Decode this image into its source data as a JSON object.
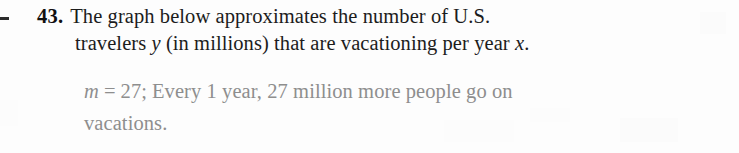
{
  "page": {
    "background_color": "#fdfdfd",
    "text_color": "#1c1c1c",
    "answer_color": "#8e8e8e"
  },
  "margin_mark": {
    "name": "margin-dash",
    "glyph": "-"
  },
  "problem": {
    "number": "43.",
    "line1": "The graph below approximates the number of U.S.",
    "line2_part1": "travelers ",
    "line2_var_y": "y",
    "line2_part2": " (in millions) that are vacationing per year ",
    "line2_var_x": "x",
    "line2_part3": "."
  },
  "answer": {
    "slope_var": "m",
    "equals": "=",
    "slope_value": "27;",
    "line1_rest": "Every 1 year, 27 million more people go on",
    "line2": "vacations."
  }
}
